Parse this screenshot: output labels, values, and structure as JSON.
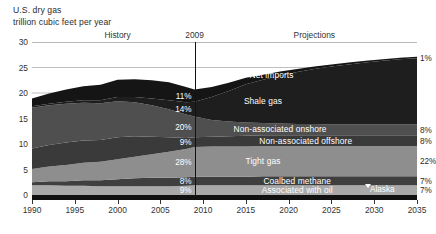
{
  "header": {
    "title_line1": "U.S. dry gas",
    "title_line2": "trillion cubic feet per year",
    "history_label": "History",
    "year_marker_label": "2009",
    "projections_label": "Projections"
  },
  "annotations": {
    "alaska_label": "Alaska"
  },
  "colors": {
    "net_imports": "#151515",
    "shale_gas": "#1e1e1e",
    "non_associated_onshore": "#4f4f4f",
    "non_associated_offshore": "#3a3a3a",
    "tight_gas": "#8e8e8e",
    "coalbed_methane": "#3f3f3f",
    "associated_with_oil": "#a9a9a9",
    "axis": "#111111",
    "gridline": "#b8b8b8",
    "marker_line": "#111111"
  },
  "chart_data": {
    "type": "area",
    "title": "U.S. dry gas",
    "subtitle": "trillion cubic feet per year",
    "xlabel": "",
    "ylabel": "trillion cubic feet per year",
    "xlim": [
      1990,
      2035
    ],
    "ylim": [
      0,
      30
    ],
    "grid": true,
    "stacked": true,
    "legend_position": "in-plot",
    "divider_year": 2009,
    "x_ticks": [
      1990,
      1995,
      2000,
      2005,
      2010,
      2015,
      2020,
      2025,
      2030,
      2035
    ],
    "y_ticks": [
      0,
      5,
      10,
      15,
      20,
      25,
      30
    ],
    "x": [
      1990,
      1992,
      1994,
      1996,
      1998,
      2000,
      2002,
      2004,
      2006,
      2008,
      2009,
      2011,
      2013,
      2015,
      2017,
      2019,
      2021,
      2023,
      2025,
      2027,
      2029,
      2031,
      2033,
      2035
    ],
    "series": [
      {
        "name": "Associated with oil",
        "label": "Associated with oil",
        "share_2009_pct": "9%",
        "share_2035_pct": "7%",
        "color": "#a9a9a9",
        "values": [
          1.9,
          1.9,
          1.8,
          1.8,
          1.7,
          1.7,
          1.7,
          1.7,
          1.7,
          1.8,
          1.9,
          1.9,
          1.9,
          1.9,
          1.9,
          1.9,
          1.9,
          1.9,
          1.9,
          1.9,
          1.9,
          1.9,
          1.9,
          1.9
        ]
      },
      {
        "name": "Coalbed methane",
        "label": "Coalbed methane",
        "share_2009_pct": "8%",
        "share_2035_pct": "7%",
        "color": "#3f3f3f",
        "values": [
          0.6,
          0.8,
          0.9,
          1.1,
          1.2,
          1.4,
          1.6,
          1.7,
          1.7,
          1.7,
          1.7,
          1.7,
          1.7,
          1.7,
          1.8,
          1.8,
          1.8,
          1.8,
          1.8,
          1.8,
          1.8,
          1.8,
          1.8,
          1.8
        ]
      },
      {
        "name": "Tight gas",
        "label": "Tight gas",
        "share_2009_pct": "28%",
        "share_2035_pct": "22%",
        "color": "#8e8e8e",
        "values": [
          2.6,
          2.9,
          3.2,
          3.4,
          3.6,
          3.9,
          4.2,
          4.6,
          5.1,
          5.5,
          5.8,
          5.9,
          5.9,
          5.9,
          5.9,
          5.9,
          5.9,
          5.9,
          5.9,
          5.9,
          5.9,
          5.9,
          5.9,
          5.9
        ]
      },
      {
        "name": "Non-associated offshore",
        "label": "Non-associated offshore",
        "share_2009_pct": "9%",
        "share_2035_pct": "8%",
        "color": "#3a3a3a",
        "values": [
          4.0,
          4.2,
          4.4,
          4.4,
          4.3,
          4.3,
          4.0,
          3.4,
          2.8,
          2.2,
          1.9,
          1.9,
          2.0,
          2.1,
          2.1,
          2.1,
          2.1,
          2.1,
          2.1,
          2.1,
          2.1,
          2.1,
          2.1,
          2.1
        ]
      },
      {
        "name": "Non-associated onshore",
        "label": "Non-associated onshore",
        "share_2009_pct": "20%",
        "share_2035_pct": "8%",
        "color": "#4f4f4f",
        "values": [
          8.0,
          7.8,
          7.6,
          7.4,
          7.2,
          7.1,
          6.7,
          6.2,
          5.5,
          4.6,
          4.1,
          3.3,
          2.9,
          2.6,
          2.4,
          2.3,
          2.2,
          2.2,
          2.1,
          2.1,
          2.1,
          2.1,
          2.1,
          2.1
        ]
      },
      {
        "name": "Shale gas",
        "label": "Shale gas",
        "share_2009_pct": "14%",
        "share_2035_pct": "—",
        "color": "#1e1e1e",
        "values": [
          0.3,
          0.3,
          0.4,
          0.5,
          0.6,
          0.8,
          1.0,
          1.3,
          1.8,
          2.4,
          2.9,
          4.5,
          6.0,
          7.5,
          8.5,
          9.4,
          10.2,
          10.8,
          11.4,
          11.8,
          12.2,
          12.5,
          12.8,
          13.0
        ]
      },
      {
        "name": "Net imports",
        "label": "Net imports",
        "share_2009_pct": "11%",
        "share_2035_pct": "1%",
        "color": "#151515",
        "values": [
          1.5,
          2.0,
          2.4,
          2.7,
          3.0,
          3.4,
          3.5,
          3.6,
          3.5,
          3.0,
          2.4,
          2.0,
          1.6,
          1.3,
          1.0,
          0.8,
          0.6,
          0.5,
          0.4,
          0.4,
          0.3,
          0.3,
          0.3,
          0.3
        ]
      }
    ],
    "left_callouts": [
      {
        "label": "11%",
        "series": "Net imports"
      },
      {
        "label": "14%",
        "series": "Shale gas"
      },
      {
        "label": "20%",
        "series": "Non-associated onshore"
      },
      {
        "label": "9%",
        "series": "Non-associated offshore"
      },
      {
        "label": "28%",
        "series": "Tight gas"
      },
      {
        "label": "8%",
        "series": "Coalbed methane"
      },
      {
        "label": "9%",
        "series": "Associated with oil"
      }
    ],
    "right_callouts": [
      {
        "label": "1%",
        "series": "Net imports"
      },
      {
        "label": "8%",
        "series": "Non-associated onshore"
      },
      {
        "label": "8%",
        "series": "Non-associated offshore"
      },
      {
        "label": "22%",
        "series": "Tight gas"
      },
      {
        "label": "7%",
        "series": "Coalbed methane"
      },
      {
        "label": "7%",
        "series": "Associated with oil"
      }
    ]
  }
}
